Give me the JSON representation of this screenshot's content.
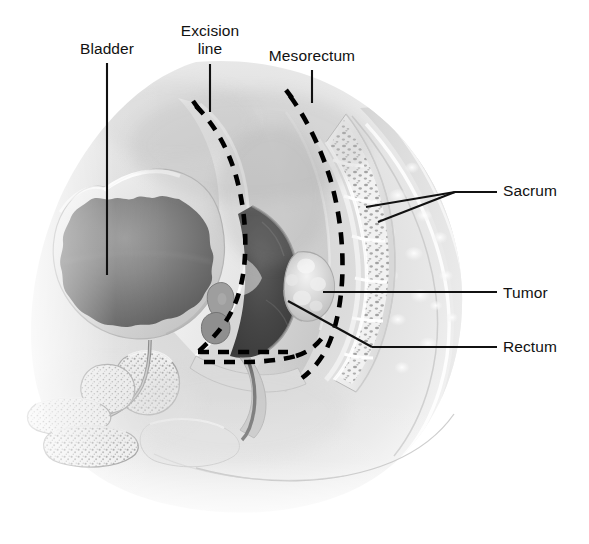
{
  "figure": {
    "type": "medical-illustration",
    "view": "sagittal section of male pelvis",
    "palette": {
      "background": "#ffffff",
      "soft_tissue_light": "#e9e9e9",
      "soft_tissue_mid": "#c9c9c9",
      "soft_tissue_dark": "#8f8f8f",
      "lumen_dark": "#4a4a4a",
      "lumen_darkest": "#3a3a3a",
      "bone_light": "#efefef",
      "bone_stipple": "#9a9a9a",
      "outline": "#111111",
      "leader_line": "#111111",
      "dashed_line": "#000000"
    }
  },
  "labels": [
    {
      "id": "bladder",
      "text": "Bladder",
      "lines": [
        "Bladder"
      ],
      "align": "center",
      "x": 76,
      "y": 40,
      "leader": {
        "type": "straight-vertical",
        "from": [
          107,
          63
        ],
        "to": [
          107,
          275
        ]
      }
    },
    {
      "id": "excision-line",
      "text": "Excision line",
      "lines": [
        "Excision",
        "line"
      ],
      "align": "center",
      "x": 148,
      "y": 22,
      "leader": {
        "type": "straight-vertical",
        "from": [
          210,
          64
        ],
        "to": [
          210,
          112
        ]
      }
    },
    {
      "id": "mesorectum",
      "text": "Mesorectum",
      "lines": [
        "Mesorectum"
      ],
      "align": "center",
      "x": 258,
      "y": 47,
      "leader": {
        "type": "straight-vertical",
        "from": [
          312,
          70
        ],
        "to": [
          312,
          103
        ]
      }
    },
    {
      "id": "sacrum",
      "text": "Sacrum",
      "lines": [
        "Sacrum"
      ],
      "align": "left",
      "x": 503,
      "y": 182,
      "leader": {
        "type": "branched",
        "horizontal": {
          "from": [
            497,
            192
          ],
          "to": [
            455,
            192
          ]
        },
        "branches": [
          {
            "from": [
              455,
              192
            ],
            "to": [
              366,
              207
            ]
          },
          {
            "from": [
              455,
              192
            ],
            "to": [
              378,
              222
            ]
          }
        ]
      }
    },
    {
      "id": "tumor",
      "text": "Tumor",
      "lines": [
        "Tumor"
      ],
      "align": "left",
      "x": 503,
      "y": 284,
      "leader": {
        "type": "straight-horizontal",
        "from": [
          497,
          292
        ],
        "to": [
          323,
          292
        ]
      }
    },
    {
      "id": "rectum",
      "text": "Rectum",
      "lines": [
        "Rectum"
      ],
      "align": "left",
      "x": 503,
      "y": 338,
      "leader": {
        "type": "angled",
        "from": [
          497,
          347
        ],
        "to": [
          372,
          347
        ],
        "tip": [
          288,
          301
        ]
      }
    }
  ],
  "structures": [
    {
      "id": "body-outline",
      "name": "body-contour",
      "description": "pelvic soft tissue silhouette, fades to white at lower left and bottom"
    },
    {
      "id": "bladder",
      "name": "urinary-bladder",
      "description": "large rounded hollow organ, scalloped muscular wall, dark lumen"
    },
    {
      "id": "prostate",
      "name": "prostate-gland",
      "description": "stippled gland below bladder neck"
    },
    {
      "id": "seminal-vesicle",
      "name": "seminal-vesicle",
      "description": "small lobulated structures between bladder and rectum"
    },
    {
      "id": "rectum",
      "name": "rectum",
      "description": "dark rectal lumen posterior to bladder"
    },
    {
      "id": "tumor",
      "name": "rectal-tumor",
      "description": "lobulated light mass on posterior rectal wall"
    },
    {
      "id": "mesorectum-fat",
      "name": "mesorectal-fat",
      "description": "fatty envelope surrounding rectum"
    },
    {
      "id": "sacrum",
      "name": "sacrum",
      "description": "curved segmented bone with five vertebral bodies and trabecular texture"
    },
    {
      "id": "gluteal",
      "name": "gluteal-soft-tissue",
      "description": "layered posterior soft tissue with mottled fat lobules"
    },
    {
      "id": "pubis",
      "name": "pubic-symphysis",
      "description": "stippled bone anterior-inferior"
    },
    {
      "id": "penile-structures",
      "name": "corpus-cavernosum",
      "description": "elongated stippled structures at lower left"
    },
    {
      "id": "urethra",
      "name": "urethra",
      "description": "thin tubular channel from bladder neck"
    }
  ],
  "excision_line": {
    "name": "excision-line-dashed",
    "style": "dashed",
    "color": "#000000",
    "description": "dashed plane following bladder posterior contour then closing beneath rectum with a double horizontal segment"
  },
  "mesorectum_line": {
    "name": "mesorectum-dashed",
    "style": "dashed",
    "color": "#000000",
    "description": "dashed curve anterior to sacrum marking mesorectal fascia"
  }
}
